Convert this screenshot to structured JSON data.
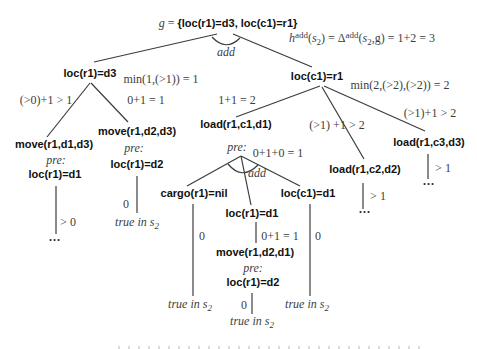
{
  "root": {
    "g": "g",
    "eq": " = ",
    "goal_set": "{loc(r1)=d3, loc(c1)=r1}"
  },
  "heuristic": {
    "h": "h",
    "sup1": "add",
    "o1": "(",
    "s1": "s",
    "sub1": "2",
    "c1": ") = ",
    "delta": "Δ",
    "sup2": "add",
    "o2": "(",
    "s2": "s",
    "sub2": "2",
    "tail": ",g) = 1+2 = 3"
  },
  "keywords": {
    "add": "add",
    "pre": "pre:",
    "true_in": "true in s",
    "s_sub": "2",
    "ellipsis": "...",
    "zero": "0",
    "gt0": "> 0",
    "gt1": "> 1"
  },
  "nodes": {
    "loc_r1_d3": "loc(r1)=d3",
    "loc_c1_r1": "loc(c1)=r1",
    "move_r1_d1_d3": "move(r1,d1,d3)",
    "move_r1_d2_d3": "move(r1,d2,d3)",
    "load_r1_c1_d1": "load(r1,c1,d1)",
    "load_r1_c2_d2": "load(r1,c2,d2)",
    "load_r1_c3_d3": "load(r1,c3,d3)",
    "cargo_r1_nil": "cargo(r1)=nil",
    "loc_r1_d1_left": "loc(r1)=d1",
    "loc_r1_d2_mid": "loc(r1)=d2",
    "loc_r1_d1_center": "loc(r1)=d1",
    "loc_c1_d1": "loc(c1)=d1",
    "move_r1_d2_d1": "move(r1,d2,d1)",
    "loc_r1_d2_center": "loc(r1)=d2"
  },
  "costs": {
    "min_loc_r1_d3": "min(1,(>1)) = 1",
    "min_loc_c1_r1": "min(2,(>2),(>2)) = 2",
    "edge_move_d1_d3": "(>0)+1 > 1",
    "edge_move_d2_d3": "0+1 = 1",
    "edge_load_c1": "1+1 = 2",
    "edge_load_c2": "(>1) +1 > 2",
    "edge_load_c3": "(>1)+1 > 2",
    "pre_load_c1": "0+1+0 = 1",
    "edge_move_d2_d1": "0+1 = 1"
  }
}
